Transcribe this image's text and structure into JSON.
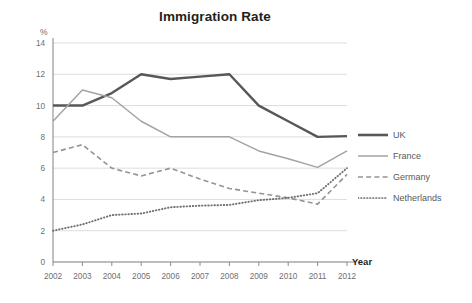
{
  "chart_data": {
    "type": "line",
    "title": "Immigration Rate",
    "xlabel": "Year",
    "ylabel": "%",
    "ylim": [
      0,
      14
    ],
    "ytick_step": 2,
    "yticks": [
      0,
      2,
      4,
      6,
      8,
      10,
      12,
      14
    ],
    "grid": true,
    "legend_position": "right",
    "categories": [
      "2002",
      "2003",
      "2004",
      "2005",
      "2006",
      "2007",
      "2008",
      "2009",
      "2010",
      "2011",
      "2012"
    ],
    "x": [
      2002,
      2003,
      2004,
      2005,
      2006,
      2007,
      2008,
      2009,
      2010,
      2011,
      2012
    ],
    "series": [
      {
        "name": "UK",
        "style": "solid-thick",
        "color": "#575757",
        "values": [
          10.0,
          10.0,
          10.8,
          12.0,
          11.7,
          11.85,
          12.0,
          10.0,
          9.0,
          8.0,
          8.05
        ]
      },
      {
        "name": "France",
        "style": "solid-thin",
        "color": "#a3a3a3",
        "values": [
          9.0,
          11.0,
          10.5,
          9.0,
          8.0,
          8.0,
          8.0,
          7.1,
          6.6,
          6.05,
          7.1
        ]
      },
      {
        "name": "Germany",
        "style": "dashed",
        "color": "#949494",
        "values": [
          7.0,
          7.5,
          6.0,
          5.5,
          6.0,
          5.3,
          4.7,
          4.4,
          4.1,
          3.7,
          5.6
        ]
      },
      {
        "name": "Netherlands",
        "style": "dotted",
        "color": "#6e6e6e",
        "values": [
          2.0,
          2.4,
          3.0,
          3.1,
          3.5,
          3.6,
          3.65,
          3.95,
          4.1,
          4.4,
          6.0
        ]
      }
    ]
  },
  "legend": {
    "items": [
      {
        "label": "UK"
      },
      {
        "label": "France"
      },
      {
        "label": "Germany"
      },
      {
        "label": "Netherlands"
      }
    ]
  },
  "colors": {
    "background": "#ffffff",
    "grid": "#d9d9d9",
    "axis": "#8c8c8c",
    "title_text": "#231f20",
    "tick_text": "#6f6f6f"
  }
}
